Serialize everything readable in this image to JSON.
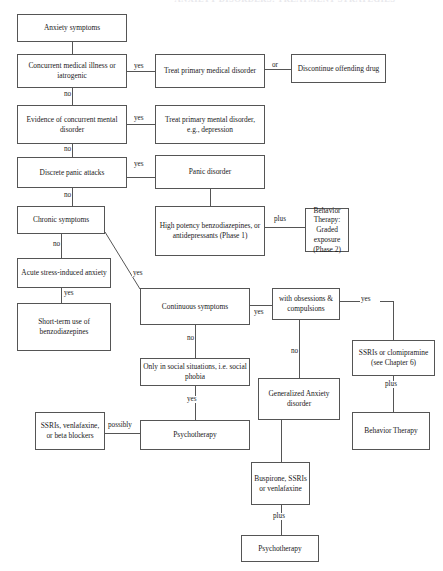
{
  "document": {
    "title_partial": "ANXIETY DISORDERS: TREATMENT STRATEGIES",
    "type": "clinical-decision-flowchart"
  },
  "nodes": {
    "anxiety_symptoms": "Anxiety symptoms",
    "concurrent_medical": "Concurrent medical illness or iatrogenic",
    "treat_medical": "Treat primary medical disorder",
    "discontinue_drug": "Discontinue offending drug",
    "evidence_mental": "Evidence of concurrent mental disorder",
    "treat_mental": "Treat primary mental disorder, e.g., depression",
    "discrete_panic": "Discrete panic attacks",
    "panic_disorder": "Panic disorder",
    "chronic_symptoms": "Chronic symptoms",
    "high_potency": "High potency benzodiazepines, or antidepressants (Phase 1)",
    "behavior_graded": "Behavior Therapy: Graded exposure (Phase 2)",
    "acute_stress": "Acute stress-induced anxiety",
    "short_term": "Short-term use of benzodiazepines",
    "continuous_symptoms": "Continuous symptoms",
    "obsessions": "with obsessions & compulsions",
    "ssri_clomipramine": "SSRIs or clomipramine (see Chapter 6)",
    "behavior_therapy": "Behavior Therapy",
    "social_situations": "Only in social situations, i.e. social phobia",
    "generalized_anxiety": "Generalized Anxiety disorder",
    "ssri_venlafaxine_beta": "SSRIs, venlafaxine, or beta blockers",
    "psychotherapy_social": "Psychotherapy",
    "buspirone": "Buspirone, SSRIs or venlafaxine",
    "psychotherapy_gad": "Psychotherapy"
  },
  "edge_labels": {
    "yes_medical": "yes",
    "or_medical": "or",
    "no_medical": "no",
    "yes_mental": "yes",
    "no_mental": "no",
    "yes_panic": "yes",
    "no_panic": "no",
    "plus_phase": "plus",
    "no_chronic": "no",
    "yes_acute": "yes",
    "yes_diagonal": "yes",
    "yes_continuous": "yes",
    "no_continuous": "no",
    "yes_obsessions": "yes",
    "no_obsessions": "no",
    "plus_ocd": "plus",
    "yes_social": "yes",
    "possibly_social": "possibly",
    "plus_gad": "plus"
  },
  "style": {
    "border_color": "#555555",
    "text_color": "#1a1a1a",
    "background": "#ffffff"
  }
}
